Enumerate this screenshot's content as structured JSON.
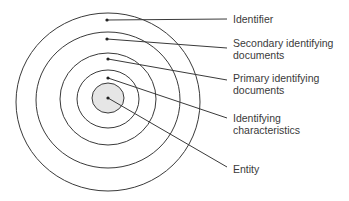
{
  "diagram": {
    "type": "concentric-circles",
    "center": {
      "x": 108,
      "y": 98
    },
    "rings": [
      {
        "name": "identifier",
        "radius": 92,
        "dot_y": 20,
        "label_y": 19,
        "label": "Identifier"
      },
      {
        "name": "secondary-identifying-documents",
        "radius": 72,
        "dot_y": 39,
        "label_y": 48,
        "label": "Secondary identifying\ndocuments"
      },
      {
        "name": "primary-identifying-documents",
        "radius": 48,
        "dot_y": 59,
        "label_y": 80,
        "label": "Primary identifying\ndocuments"
      },
      {
        "name": "identifying-characteristics",
        "radius": 30,
        "dot_y": 78,
        "label_y": 118,
        "label": "Identifying\ncharacteristics"
      },
      {
        "name": "entity",
        "radius": 16,
        "dot_y": 98,
        "label_y": 167,
        "label": "Entity",
        "fill": "#e6e6e6"
      }
    ],
    "line_end_x": 227,
    "stroke_color": "#3a3a3a"
  },
  "labels": {
    "identifier": "Identifier",
    "secondary": "Secondary identifying\ndocuments",
    "primary": "Primary identifying\ndocuments",
    "characteristics": "Identifying\ncharacteristics",
    "entity": "Entity"
  }
}
